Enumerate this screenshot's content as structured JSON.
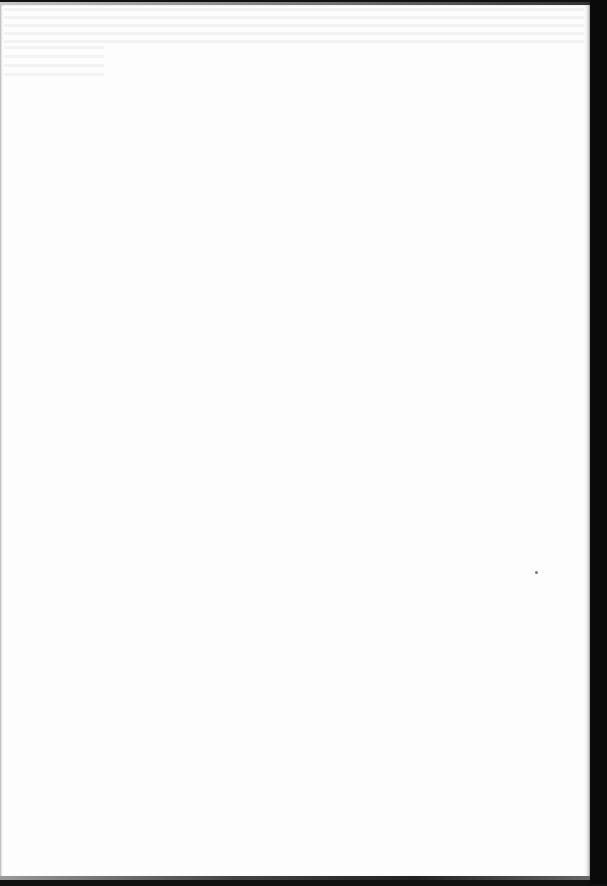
{
  "document": {
    "type": "scanned-page",
    "content": "",
    "page_color": "#fdfdfd",
    "border_color": "#0a0a0a",
    "marks": [
      {
        "kind": "speck",
        "x": 536,
        "y": 570
      }
    ]
  }
}
